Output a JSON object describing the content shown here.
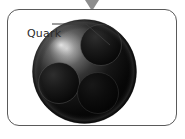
{
  "figure": {
    "title": "Quark",
    "marker": "down-triangle-marker",
    "panel": {
      "border_color": "#5a5a5a",
      "background_color": "#ffffff",
      "corner_radius": 12
    },
    "annotations": [
      {
        "label": "Quark",
        "leader_from": [
          52,
          24
        ],
        "leader_bend": [
          86,
          24
        ],
        "leader_to": [
          110,
          45
        ]
      }
    ],
    "sphere": {
      "name": "nucleon-sphere",
      "center": [
        93,
        71
      ],
      "radius": 52,
      "base_color": "#0a0a0a",
      "highlight_color": "#bdbdbd",
      "rim_color": "#4a4a4a"
    },
    "quarks": [
      {
        "name": "quark-top-right",
        "center": [
          117,
          49
        ],
        "radius": 20
      },
      {
        "name": "quark-bottom-left",
        "center": [
          72,
          89
        ],
        "radius": 20
      },
      {
        "name": "quark-bottom-right",
        "center": [
          114,
          97
        ],
        "radius": 20
      }
    ],
    "colors": {
      "marker": "#8d8d8d",
      "label_text": "#2b2b2b",
      "leader_line": "#3a3a3a"
    }
  }
}
